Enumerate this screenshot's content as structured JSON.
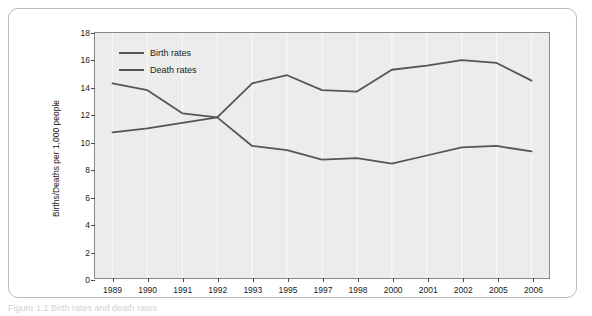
{
  "chart_data": {
    "type": "line",
    "title": "",
    "xlabel": "",
    "ylabel": "Births/Deaths per 1,000 people",
    "categories": [
      "1989",
      "1990",
      "1991",
      "1992",
      "1993",
      "1995",
      "1997",
      "1998",
      "2000",
      "2001",
      "2002",
      "2005",
      "2006"
    ],
    "ylim": [
      0,
      18
    ],
    "yticks": [
      0,
      2,
      4,
      6,
      8,
      10,
      12,
      14,
      16,
      18
    ],
    "grid": true,
    "legend_position": "top-left",
    "series": [
      {
        "name": "Birth rates",
        "color": "#555555",
        "values": [
          14.3,
          13.8,
          12.1,
          11.8,
          9.7,
          9.4,
          8.7,
          8.8,
          8.4,
          9.0,
          9.6,
          9.7,
          9.3
        ]
      },
      {
        "name": "Death rates",
        "color": "#555555",
        "values": [
          10.7,
          11.0,
          11.4,
          11.8,
          14.3,
          14.9,
          13.8,
          13.7,
          15.3,
          15.6,
          16.0,
          15.8,
          14.5
        ]
      }
    ]
  },
  "legend": {
    "items": [
      {
        "label": "Birth rates"
      },
      {
        "label": "Death rates"
      }
    ]
  },
  "caption": {
    "text": "Figure 1.1 Birth rates and death rates"
  }
}
